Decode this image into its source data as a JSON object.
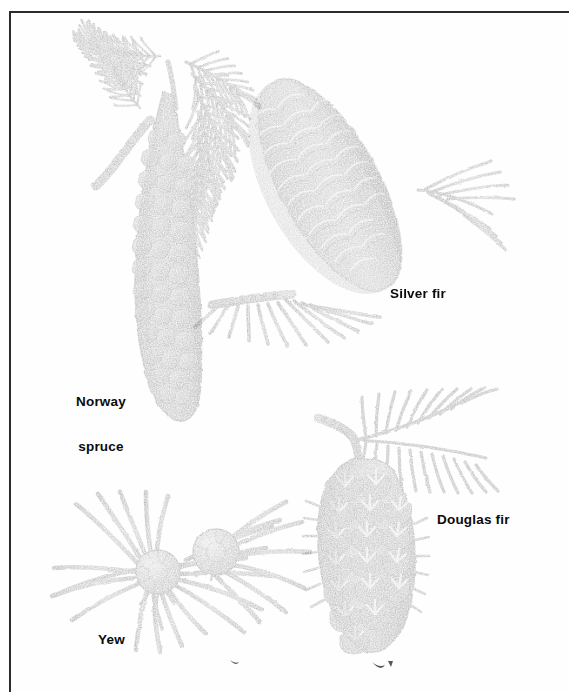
{
  "plate": {
    "kind": "botanical-illustration",
    "subject": "conifer cones and foliage",
    "style": "black-and-white halftone engraving",
    "background_color": "#ffffff",
    "border_color": "#2b2b2b",
    "ink_color": "#1a1a1a",
    "width": 569,
    "height": 692
  },
  "specimens": [
    {
      "id": "norway-spruce",
      "label": "Norway\nspruce",
      "label_line1": "Norway",
      "label_line2": "spruce",
      "position": "upper-left",
      "description": "long pendulous cone with rhombic scales and needle sprays above"
    },
    {
      "id": "silver-fir",
      "label": "Silver fir",
      "position": "upper-right",
      "description": "upright barrel cone with bracted scales and needles at base"
    },
    {
      "id": "douglas-fir",
      "label": "Douglas fir",
      "position": "lower-right",
      "description": "hanging cone with three-pointed protruding bracts and a needle spray"
    },
    {
      "id": "yew",
      "label": "Yew",
      "position": "lower-left",
      "description": "flat spreading needles with two rounded seed arils"
    }
  ]
}
